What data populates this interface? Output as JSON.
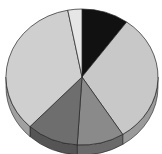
{
  "chart_data": {
    "type": "pie",
    "style": "3d",
    "title": "",
    "legend": "none",
    "categories": [
      "Slice A",
      "Slice B",
      "Slice C",
      "Slice D",
      "Slice E",
      "Slice F"
    ],
    "values": [
      10,
      31,
      10,
      11,
      35,
      3
    ],
    "colors": [
      "#111111",
      "#c8c8c8",
      "#8a8a8a",
      "#6e6e6e",
      "#cfcfcf",
      "#e6e6e6"
    ],
    "side_colors": [
      "#0a0a0a",
      "#9a9a9a",
      "#6a6a6a",
      "#555555",
      "#a0a0a0",
      "#bdbdbd"
    ],
    "start_angle_deg": -90
  },
  "geometry": {
    "cx": 82,
    "cy": 77,
    "rx": 76,
    "ry": 68,
    "depth": 10
  }
}
